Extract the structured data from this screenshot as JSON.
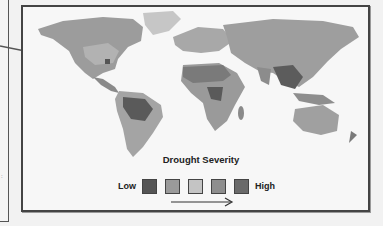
{
  "map": {
    "title": "Drought Severity",
    "legend": {
      "low_label": "Low",
      "high_label": "High",
      "swatches": [
        {
          "level": 1,
          "color": "#555555"
        },
        {
          "level": 2,
          "color": "#9a9a9a"
        },
        {
          "level": 3,
          "color": "#c4c4c4"
        },
        {
          "level": 4,
          "color": "#8e8e8e"
        },
        {
          "level": 5,
          "color": "#6a6a6a"
        }
      ]
    },
    "pointer_arrow": "arrow-right-icon",
    "direction_arrow": "arrow-right-icon"
  }
}
